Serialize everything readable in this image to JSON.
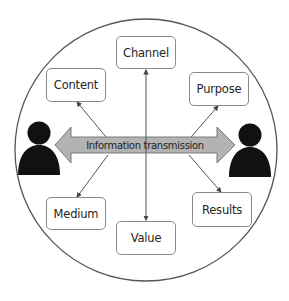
{
  "diagram": {
    "colors": {
      "circle_stroke": "#555555",
      "box_border": "#8a8a8a",
      "arrow_fill": "#b3b3b3",
      "arrow_stroke": "#7a7a7a",
      "person_fill": "#111111",
      "connector_line": "#444444"
    },
    "center_arrow": {
      "label": "Information transmission",
      "direction": "bidirectional"
    },
    "actors": [
      {
        "id": "sender",
        "icon": "person-icon",
        "position": "left"
      },
      {
        "id": "receiver",
        "icon": "person-icon",
        "position": "right"
      }
    ],
    "nodes": [
      {
        "id": "channel",
        "label": "Channel",
        "position": "top"
      },
      {
        "id": "content",
        "label": "Content",
        "position": "top-left"
      },
      {
        "id": "purpose",
        "label": "Purpose",
        "position": "top-right"
      },
      {
        "id": "medium",
        "label": "Medium",
        "position": "bottom-left"
      },
      {
        "id": "value",
        "label": "Value",
        "position": "bottom"
      },
      {
        "id": "results",
        "label": "Results",
        "position": "bottom-right"
      }
    ],
    "edges": [
      {
        "from": "center",
        "to": "channel"
      },
      {
        "from": "center",
        "to": "content"
      },
      {
        "from": "center",
        "to": "purpose"
      },
      {
        "from": "center",
        "to": "medium"
      },
      {
        "from": "center",
        "to": "value"
      },
      {
        "from": "center",
        "to": "results"
      }
    ]
  }
}
